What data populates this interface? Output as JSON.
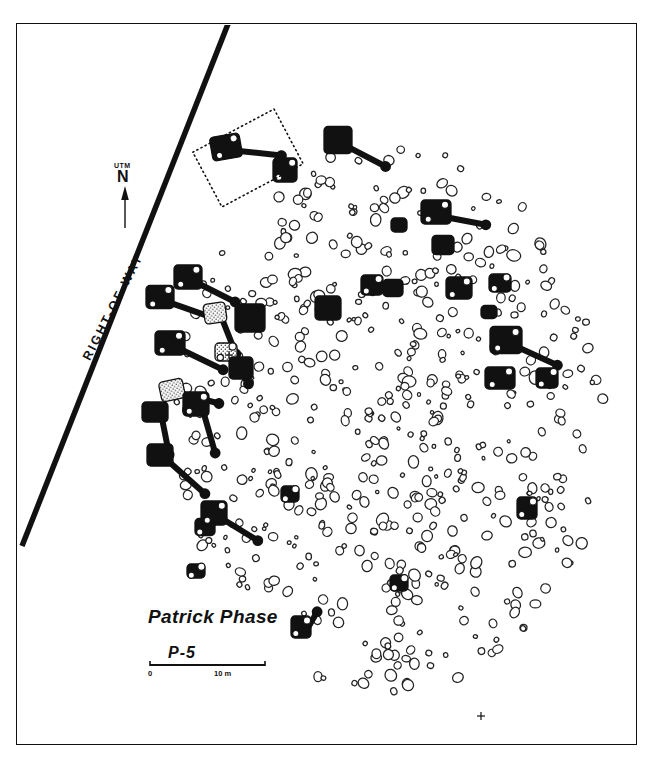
{
  "figure": {
    "kind": "archaeological-site-plan",
    "site_code": "P-5",
    "phase_label": "Patrick Phase",
    "boundary_label": "RIGHT-OF-WAY",
    "north": {
      "datum": "UTM",
      "letter": "N"
    },
    "scale_bar": {
      "min": "0",
      "max": "10 m"
    },
    "colors": {
      "ink": "#111111",
      "paper": "#ffffff",
      "structure_fill": "#111111",
      "stipple_fill": "#d8d8d8",
      "postmold_stroke": "#222222"
    }
  },
  "chart_data": {
    "type": "scatter",
    "title": "Patrick Phase",
    "subtitle": "P-5",
    "xlabel": "",
    "ylabel": "",
    "legend_position": "none",
    "grid": false,
    "right_of_way": {
      "x1": 228,
      "y1": 24,
      "x2": 22,
      "y2": 546
    },
    "excavation_block": {
      "cx": 248,
      "cy": 158,
      "w": 92,
      "h": 62,
      "rot": -28
    },
    "datum_marks": [
      {
        "x": 481,
        "y": 716
      },
      {
        "x": 229,
        "y": 355
      }
    ],
    "scale_bar_px": {
      "x1": 150,
      "y1": 665,
      "x2": 265,
      "y2": 665
    },
    "structures": [
      {
        "x": 226,
        "y": 147,
        "w": 30,
        "h": 24,
        "rot": -10,
        "fill": "solid",
        "neck": {
          "dx": 32,
          "dy": 12,
          "len": 22,
          "ang": 16
        },
        "port": true
      },
      {
        "x": 285,
        "y": 170,
        "w": 24,
        "h": 24,
        "rot": 0,
        "fill": "solid",
        "neck": null,
        "port": true
      },
      {
        "x": 338,
        "y": 140,
        "w": 28,
        "h": 27,
        "rot": 0,
        "fill": "solid",
        "neck": {
          "dx": 26,
          "dy": 16,
          "len": 24,
          "ang": 26
        },
        "port": false
      },
      {
        "x": 436,
        "y": 212,
        "w": 30,
        "h": 24,
        "rot": 0,
        "fill": "solid",
        "neck": {
          "dx": 30,
          "dy": 10,
          "len": 20,
          "ang": 8
        },
        "port": true
      },
      {
        "x": 443,
        "y": 245,
        "w": 22,
        "h": 19,
        "rot": 0,
        "fill": "solid",
        "neck": null,
        "port": false
      },
      {
        "x": 459,
        "y": 288,
        "w": 26,
        "h": 22,
        "rot": 0,
        "fill": "solid",
        "neck": null,
        "port": true
      },
      {
        "x": 500,
        "y": 283,
        "w": 22,
        "h": 18,
        "rot": 0,
        "fill": "solid",
        "neck": null,
        "port": true
      },
      {
        "x": 188,
        "y": 277,
        "w": 28,
        "h": 24,
        "rot": 0,
        "fill": "solid",
        "neck": {
          "dx": 27,
          "dy": 16,
          "len": 22,
          "ang": 24
        },
        "port": true
      },
      {
        "x": 160,
        "y": 297,
        "w": 28,
        "h": 23,
        "rot": 0,
        "fill": "solid",
        "neck": {
          "dx": 27,
          "dy": 14,
          "len": 24,
          "ang": 14
        },
        "port": true
      },
      {
        "x": 250,
        "y": 318,
        "w": 30,
        "h": 28,
        "rot": 0,
        "fill": "solid",
        "neck": null,
        "port": false
      },
      {
        "x": 215,
        "y": 313,
        "w": 22,
        "h": 20,
        "rot": -8,
        "fill": "stipple",
        "neck": {
          "dx": 10,
          "dy": 20,
          "len": 24,
          "ang": 78
        },
        "port": false
      },
      {
        "x": 170,
        "y": 343,
        "w": 30,
        "h": 24,
        "rot": 0,
        "fill": "solid",
        "neck": {
          "dx": 29,
          "dy": 17,
          "len": 26,
          "ang": 22
        },
        "port": true
      },
      {
        "x": 226,
        "y": 352,
        "w": 22,
        "h": 18,
        "rot": 0,
        "fill": "stipple",
        "neck": {
          "dx": 14,
          "dy": 16,
          "len": 18,
          "ang": 62
        },
        "port": true
      },
      {
        "x": 241,
        "y": 368,
        "w": 24,
        "h": 22,
        "rot": 0,
        "fill": "solid",
        "neck": null,
        "port": false
      },
      {
        "x": 172,
        "y": 390,
        "w": 24,
        "h": 20,
        "rot": -12,
        "fill": "stipple",
        "neck": {
          "dx": 23,
          "dy": 14,
          "len": 22,
          "ang": 24
        },
        "port": false
      },
      {
        "x": 196,
        "y": 404,
        "w": 26,
        "h": 24,
        "rot": 0,
        "fill": "solid",
        "neck": {
          "dx": 12,
          "dy": 24,
          "len": 26,
          "ang": 74
        },
        "port": true
      },
      {
        "x": 155,
        "y": 412,
        "w": 26,
        "h": 20,
        "rot": 0,
        "fill": "solid",
        "neck": {
          "dx": 10,
          "dy": 19,
          "len": 24,
          "ang": 80
        },
        "port": false
      },
      {
        "x": 328,
        "y": 308,
        "w": 26,
        "h": 24,
        "rot": 0,
        "fill": "solid",
        "neck": null,
        "port": false
      },
      {
        "x": 372,
        "y": 285,
        "w": 22,
        "h": 20,
        "rot": 0,
        "fill": "solid",
        "neck": null,
        "port": true
      },
      {
        "x": 393,
        "y": 288,
        "w": 20,
        "h": 17,
        "rot": 0,
        "fill": "solid",
        "neck": null,
        "port": false
      },
      {
        "x": 506,
        "y": 340,
        "w": 32,
        "h": 27,
        "rot": 0,
        "fill": "solid",
        "neck": {
          "dx": 31,
          "dy": 17,
          "len": 22,
          "ang": 22
        },
        "port": true
      },
      {
        "x": 500,
        "y": 378,
        "w": 30,
        "h": 22,
        "rot": 0,
        "fill": "solid",
        "neck": null,
        "port": true
      },
      {
        "x": 547,
        "y": 378,
        "w": 22,
        "h": 20,
        "rot": 0,
        "fill": "solid",
        "neck": null,
        "port": true
      },
      {
        "x": 160,
        "y": 455,
        "w": 26,
        "h": 22,
        "rot": 0,
        "fill": "solid",
        "neck": {
          "dx": 25,
          "dy": 22,
          "len": 26,
          "ang": 40
        },
        "port": false
      },
      {
        "x": 205,
        "y": 527,
        "w": 20,
        "h": 17,
        "rot": 0,
        "fill": "solid",
        "neck": null,
        "port": true
      },
      {
        "x": 196,
        "y": 571,
        "w": 18,
        "h": 14,
        "rot": 0,
        "fill": "solid",
        "neck": null,
        "port": true
      },
      {
        "x": 214,
        "y": 513,
        "w": 26,
        "h": 24,
        "rot": 0,
        "fill": "solid",
        "neck": {
          "dx": 24,
          "dy": 18,
          "len": 22,
          "ang": 26
        },
        "port": true
      },
      {
        "x": 290,
        "y": 494,
        "w": 18,
        "h": 16,
        "rot": 0,
        "fill": "solid",
        "neck": null,
        "port": true
      },
      {
        "x": 301,
        "y": 627,
        "w": 20,
        "h": 22,
        "rot": 0,
        "fill": "solid",
        "neck": {
          "dx": 12,
          "dy": -4,
          "len": 12,
          "ang": -70
        },
        "port": true
      },
      {
        "x": 399,
        "y": 583,
        "w": 18,
        "h": 16,
        "rot": 0,
        "fill": "solid",
        "neck": null,
        "port": true
      },
      {
        "x": 527,
        "y": 508,
        "w": 20,
        "h": 22,
        "rot": 0,
        "fill": "solid",
        "neck": null,
        "port": true
      },
      {
        "x": 399,
        "y": 225,
        "w": 16,
        "h": 14,
        "rot": 0,
        "fill": "solid",
        "neck": null,
        "port": false
      },
      {
        "x": 489,
        "y": 312,
        "w": 16,
        "h": 13,
        "rot": 0,
        "fill": "solid",
        "neck": null,
        "port": false
      }
    ],
    "postmold_count": 560,
    "postmold_seed": 20250114
  }
}
